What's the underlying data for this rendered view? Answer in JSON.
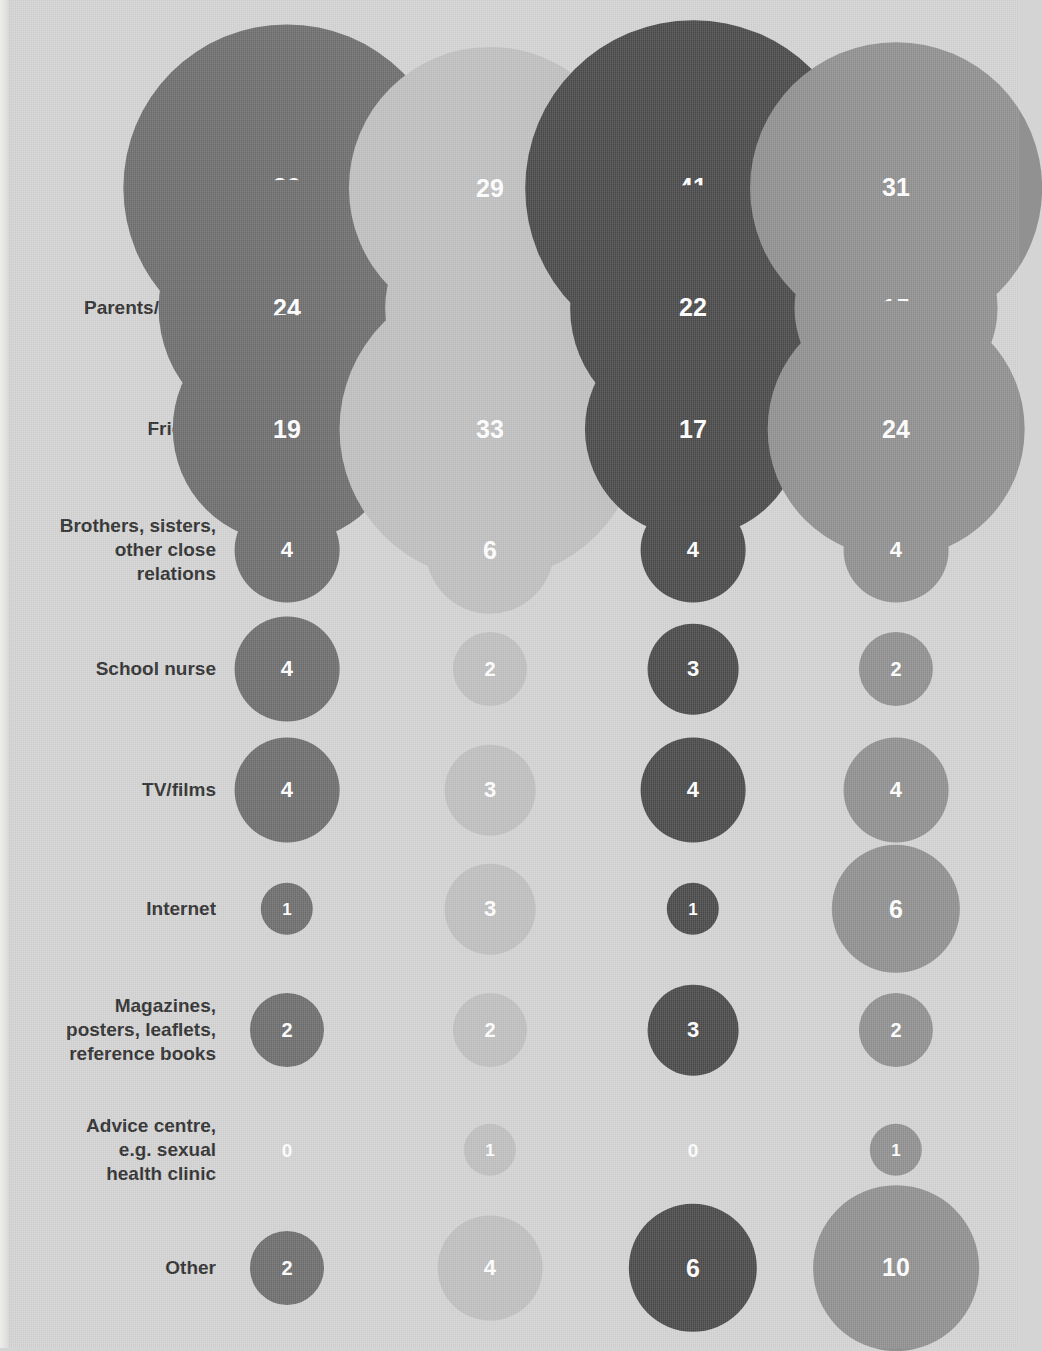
{
  "chart_data": {
    "type": "bubble",
    "title": "",
    "subtitle": "",
    "xlabel": "",
    "ylabel": "",
    "legend_position": "top",
    "grid": false,
    "value_unit": "percent",
    "note": "Bubble area is proportional to the value; radius scales with the square root of the value. A value of 0 is shown as a white numeral with no bubble.",
    "categories": [
      "School lessons",
      "Parents/carers",
      "Friends",
      "Brothers, sisters, other close relations",
      "School nurse",
      "TV/films",
      "Internet",
      "Magazines, posters, leaflets, reference books",
      "Advice centre, e.g. sexual health clinic",
      "Other"
    ],
    "series": [
      {
        "name": "Girls 12-13",
        "color": "#6e6e6e",
        "values": [
          39,
          24,
          19,
          4,
          4,
          4,
          1,
          2,
          0,
          2
        ]
      },
      {
        "name": "Girls 14-15",
        "color": "#c0c0c0",
        "values": [
          29,
          16,
          33,
          6,
          2,
          3,
          3,
          2,
          1,
          4
        ]
      },
      {
        "name": "Boys 12-13",
        "color": "#4a4a4a",
        "values": [
          41,
          22,
          17,
          4,
          3,
          4,
          1,
          3,
          0,
          6
        ]
      },
      {
        "name": "Boys 14-15",
        "color": "#919191",
        "values": [
          31,
          15,
          24,
          4,
          2,
          4,
          6,
          2,
          1,
          10
        ]
      }
    ]
  },
  "columns": [
    {
      "group": "Girls",
      "age": "12-13",
      "label": "Girls\n12-13",
      "color": "#6e6e6e",
      "center_x": 287
    },
    {
      "group": "Girls",
      "age": "14-15",
      "label": "Girls\n14-15",
      "color": "#c0c0c0",
      "center_x": 490
    },
    {
      "group": "Boys",
      "age": "12-13",
      "label": "Boys\n12-13",
      "color": "#4a4a4a",
      "center_x": 693
    },
    {
      "group": "Boys",
      "age": "14-15",
      "label": "Boys\n14-15",
      "color": "#919191",
      "center_x": 896
    }
  ],
  "rows": [
    {
      "label": "School\nlessons",
      "center_y": 188
    },
    {
      "label": "Parents/carers",
      "center_y": 308
    },
    {
      "label": "Friends",
      "center_y": 429
    },
    {
      "label": "Brothers, sisters,\nother close\nrelations",
      "center_y": 550
    },
    {
      "label": "School nurse",
      "center_y": 669
    },
    {
      "label": "TV/films",
      "center_y": 790
    },
    {
      "label": "Internet",
      "center_y": 909
    },
    {
      "label": "Magazines,\nposters, leaflets,\nreference books",
      "center_y": 1030
    },
    {
      "label": "Advice centre,\ne.g. sexual\nhealth clinic",
      "center_y": 1150
    },
    {
      "label": "Other",
      "center_y": 1268
    }
  ],
  "layout": {
    "header_y": 52,
    "label_right_edge": 216,
    "radius_scale": 26.2,
    "background_color": "#d4d4d4",
    "label_text_color": "#2f2f2f",
    "value_text_color": "#ffffff"
  }
}
